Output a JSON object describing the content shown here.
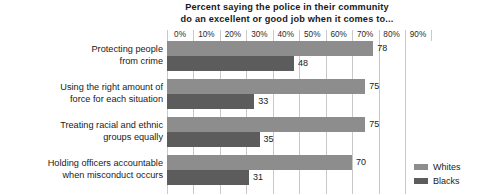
{
  "chart_data": {
    "type": "bar",
    "orientation": "horizontal",
    "title": "Percent saying the police in their community do an excellent or good job when it comes to...",
    "title_lines": [
      "Percent saying the police in their community",
      "do an excellent or good job when it comes to..."
    ],
    "xlabel": "",
    "ylabel": "",
    "xlim": [
      0,
      90
    ],
    "grid": true,
    "legend_position": "right-bottom",
    "tick_labels": [
      "0%",
      "10%",
      "20%",
      "30%",
      "40%",
      "50%",
      "60%",
      "70%",
      "80%",
      "90%"
    ],
    "tick_values": [
      0,
      10,
      20,
      30,
      40,
      50,
      60,
      70,
      80,
      90
    ],
    "categories": [
      "Protecting people from crime",
      "Using the right amount of force for each situation",
      "Treating racial and ethnic groups equally",
      "Holding officers accountable when misconduct occurs"
    ],
    "category_lines": [
      [
        "Protecting people",
        "from crime"
      ],
      [
        "Using the right amount of",
        "force for each situation"
      ],
      [
        "Treating racial and ethnic",
        "groups equally"
      ],
      [
        "Holding officers accountable",
        "when misconduct occurs"
      ]
    ],
    "series": [
      {
        "name": "Whites",
        "color": "#8d8d8d",
        "values": [
          78,
          75,
          75,
          70
        ]
      },
      {
        "name": "Blacks",
        "color": "#5c5c5c",
        "values": [
          48,
          33,
          35,
          31
        ]
      }
    ],
    "value_labels": {
      "whites": [
        "78",
        "75",
        "75",
        "70"
      ],
      "blacks": [
        "48",
        "33",
        "35",
        "31"
      ]
    }
  },
  "legend": {
    "items": [
      {
        "label": "Whites",
        "color": "#8d8d8d"
      },
      {
        "label": "Blacks",
        "color": "#5c5c5c"
      }
    ]
  }
}
